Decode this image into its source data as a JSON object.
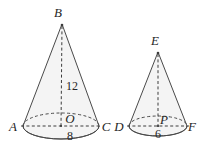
{
  "figure": {
    "background_color": "#ffffff",
    "stroke_color": "#4a4a4a",
    "fill_color": "#f4f4f4",
    "label_color": "#262626",
    "cones": [
      {
        "id": "left-cone",
        "apex_label": "B",
        "center_label": "O",
        "base_left_label": "A",
        "base_right_label": "C",
        "height_label": "12",
        "diameter_label": "8",
        "apex": {
          "x": 62,
          "y": 24
        },
        "base_center": {
          "x": 61,
          "y": 126
        },
        "base_rx": 38,
        "base_ry": 13
      },
      {
        "id": "right-cone",
        "apex_label": "E",
        "center_label": "P",
        "base_left_label": "D",
        "base_right_label": "F",
        "height_label": "",
        "diameter_label": "6",
        "apex": {
          "x": 158,
          "y": 52
        },
        "base_center": {
          "x": 158,
          "y": 126
        },
        "base_rx": 29,
        "base_ry": 10
      }
    ]
  }
}
